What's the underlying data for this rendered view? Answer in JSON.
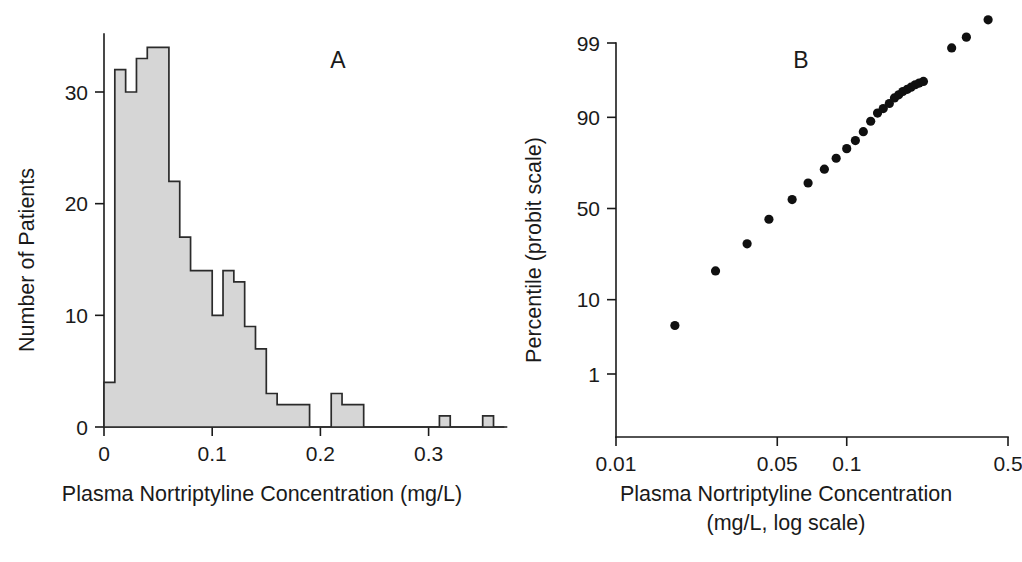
{
  "figure": {
    "background_color": "#ffffff",
    "ink_color": "#1a1a1a",
    "histogram_fill_color": "#d6d6d6",
    "histogram_stroke_color": "#2b2b2b",
    "dot_color": "#101010"
  },
  "panel_a": {
    "letter": "A",
    "chart_data": {
      "type": "bar",
      "title": "",
      "subtitle": "",
      "xlabel": "Plasma Nortriptyline Concentration (mg/L)",
      "ylabel": "Number of Patients",
      "xlim": [
        0.0,
        0.37
      ],
      "ylim": [
        0,
        35
      ],
      "xticks": [
        0,
        0.1,
        0.2,
        0.3
      ],
      "xtick_labels": [
        "0",
        "0.1",
        "0.2",
        "0.3"
      ],
      "yticks": [
        0,
        10,
        20,
        30
      ],
      "ytick_labels": [
        "0",
        "10",
        "20",
        "30"
      ],
      "grid": false,
      "legend": false,
      "bin_width": 0.01,
      "bin_starts": [
        0.0,
        0.01,
        0.02,
        0.03,
        0.04,
        0.05,
        0.06,
        0.07,
        0.08,
        0.09,
        0.1,
        0.11,
        0.12,
        0.13,
        0.14,
        0.15,
        0.16,
        0.17,
        0.18,
        0.19,
        0.2,
        0.21,
        0.22,
        0.23,
        0.24,
        0.25,
        0.26,
        0.27,
        0.28,
        0.29,
        0.3,
        0.31,
        0.32,
        0.33,
        0.34,
        0.35,
        0.36
      ],
      "categories": [
        "0.00-0.01",
        "0.01-0.02",
        "0.02-0.03",
        "0.03-0.04",
        "0.04-0.05",
        "0.05-0.06",
        "0.06-0.07",
        "0.07-0.08",
        "0.08-0.09",
        "0.09-0.10",
        "0.10-0.11",
        "0.11-0.12",
        "0.12-0.13",
        "0.13-0.14",
        "0.14-0.15",
        "0.15-0.16",
        "0.16-0.17",
        "0.17-0.18",
        "0.18-0.19",
        "0.19-0.20",
        "0.20-0.21",
        "0.21-0.22",
        "0.22-0.23",
        "0.23-0.24",
        "0.24-0.25",
        "0.25-0.26",
        "0.26-0.27",
        "0.27-0.28",
        "0.28-0.29",
        "0.29-0.30",
        "0.30-0.31",
        "0.31-0.32",
        "0.32-0.33",
        "0.33-0.34",
        "0.34-0.35",
        "0.35-0.36",
        "0.36-0.37"
      ],
      "values": [
        4,
        32,
        30,
        33,
        34,
        34,
        22,
        17,
        14,
        14,
        10,
        14,
        13,
        9,
        7,
        3,
        2,
        2,
        2,
        0,
        0,
        3,
        2,
        2,
        0,
        0,
        0,
        0,
        0,
        0,
        0,
        1,
        0,
        0,
        0,
        1,
        0
      ]
    }
  },
  "panel_b": {
    "letter": "B",
    "chart_data": {
      "type": "scatter",
      "title": "",
      "subtitle": "",
      "xlabel_line1": "Plasma Nortriptyline Concentration",
      "xlabel_line2": "(mg/L, log scale)",
      "ylabel": "Percentile (probit scale)",
      "x_scale": "log",
      "y_scale": "probit",
      "xlim": [
        0.01,
        0.5
      ],
      "xticks": [
        0.01,
        0.05,
        0.1,
        0.5
      ],
      "xtick_labels": [
        "0.01",
        "0.05",
        "0.1",
        "0.5"
      ],
      "yticks": [
        1,
        10,
        50,
        90,
        99
      ],
      "ytick_labels": [
        "1",
        "10",
        "50",
        "90",
        "99"
      ],
      "grid": false,
      "legend": false,
      "points": [
        {
          "x": 0.018,
          "y": 5
        },
        {
          "x": 0.027,
          "y": 19
        },
        {
          "x": 0.037,
          "y": 31
        },
        {
          "x": 0.046,
          "y": 44
        },
        {
          "x": 0.058,
          "y": 55
        },
        {
          "x": 0.068,
          "y": 64
        },
        {
          "x": 0.08,
          "y": 71
        },
        {
          "x": 0.09,
          "y": 76
        },
        {
          "x": 0.1,
          "y": 80
        },
        {
          "x": 0.109,
          "y": 83
        },
        {
          "x": 0.118,
          "y": 86
        },
        {
          "x": 0.127,
          "y": 89
        },
        {
          "x": 0.136,
          "y": 91
        },
        {
          "x": 0.144,
          "y": 92
        },
        {
          "x": 0.153,
          "y": 93
        },
        {
          "x": 0.161,
          "y": 94
        },
        {
          "x": 0.168,
          "y": 94.5
        },
        {
          "x": 0.175,
          "y": 95
        },
        {
          "x": 0.183,
          "y": 95.3
        },
        {
          "x": 0.19,
          "y": 95.6
        },
        {
          "x": 0.198,
          "y": 95.9
        },
        {
          "x": 0.206,
          "y": 96.1
        },
        {
          "x": 0.215,
          "y": 96.3
        },
        {
          "x": 0.285,
          "y": 98.8
        },
        {
          "x": 0.33,
          "y": 99.2
        },
        {
          "x": 0.41,
          "y": 99.6
        }
      ]
    }
  }
}
